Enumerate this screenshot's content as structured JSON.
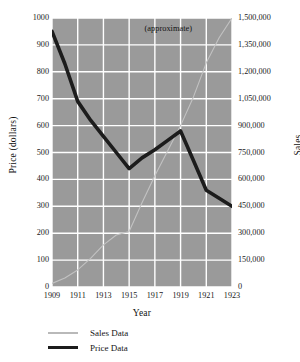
{
  "chart_data": {
    "type": "line",
    "title": "",
    "xlabel": "Year",
    "ylabel": "Price (dollars)",
    "y2label": "Sales",
    "x": [
      1909,
      1910,
      1911,
      1912,
      1913,
      1914,
      1915,
      1916,
      1917,
      1918,
      1919,
      1920,
      1921,
      1922,
      1923
    ],
    "xlim": [
      1909,
      1923
    ],
    "ylim": [
      0,
      1000
    ],
    "y2lim": [
      0,
      1500000
    ],
    "grid": true,
    "legend_position": "below-left",
    "annotations": [
      {
        "text": "(approximate)",
        "x": 1919,
        "y": 960
      }
    ],
    "xticks": [
      "1909",
      "1911",
      "1913",
      "1915",
      "1917",
      "1919",
      "1921",
      "1923"
    ],
    "xtick_values": [
      1909,
      1911,
      1913,
      1915,
      1917,
      1919,
      1921,
      1923
    ],
    "yticks": [
      "0",
      "100",
      "200",
      "300",
      "400",
      "500",
      "600",
      "700",
      "800",
      "900",
      "1000"
    ],
    "ytick_values": [
      0,
      100,
      200,
      300,
      400,
      500,
      600,
      700,
      800,
      900,
      1000
    ],
    "y2ticks": [
      "0",
      "150,000",
      "300,000",
      "450,000",
      "600,000",
      "750,000",
      "900,000",
      "1,050,000",
      "1,200,000",
      "1,350,000",
      "1,500,000"
    ],
    "y2tick_values": [
      0,
      150000,
      300000,
      450000,
      600000,
      750000,
      900000,
      1050000,
      1200000,
      1350000,
      1500000
    ],
    "series": [
      {
        "name": "Sales Data",
        "axis": "right",
        "color": "#c2c2c2",
        "width": 1.1,
        "values": [
          20000,
          50000,
          95000,
          160000,
          235000,
          290000,
          310000,
          470000,
          620000,
          760000,
          900000,
          1060000,
          1250000,
          1390000,
          1500000
        ]
      },
      {
        "name": "Price Data",
        "axis": "left",
        "color": "#1c1c1c",
        "width": 3.6,
        "values": [
          950,
          830,
          690,
          620,
          560,
          500,
          440,
          480,
          510,
          545,
          580,
          470,
          360,
          330,
          300
        ]
      }
    ],
    "legend": [
      {
        "label": "Sales Data",
        "color": "#c2c2c2",
        "style": "thin"
      },
      {
        "label": "Price Data",
        "color": "#1c1c1c",
        "style": "thick"
      }
    ],
    "colors": {
      "plot_background": "#9a9a9a",
      "gridline": "#ffffff",
      "page_background": "#ffffff",
      "text": "#111111"
    }
  }
}
